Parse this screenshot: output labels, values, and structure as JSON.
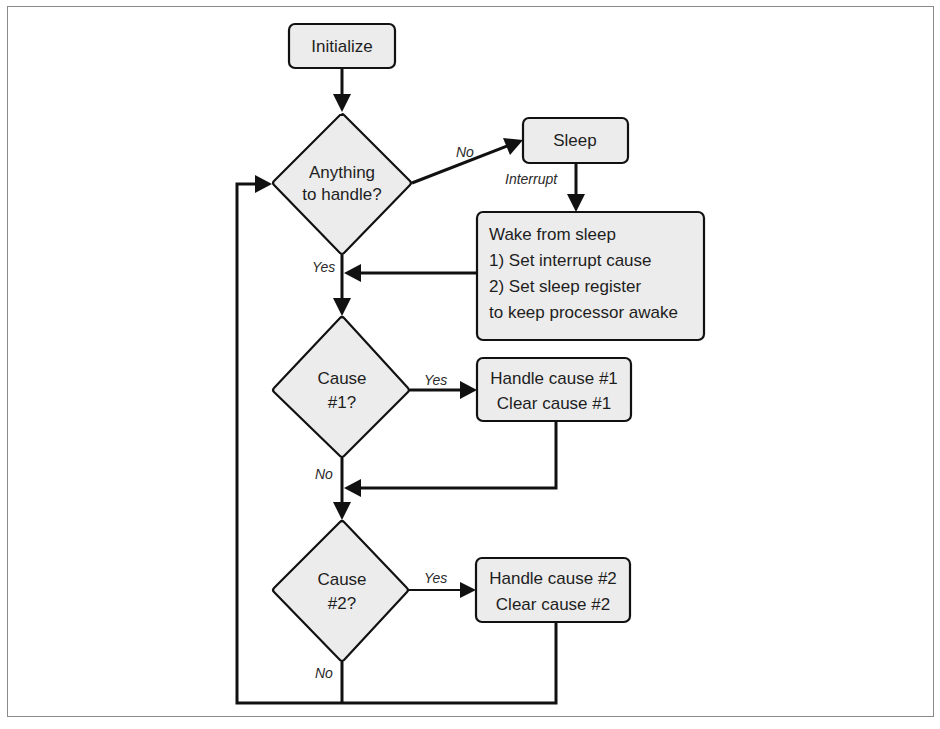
{
  "diagram": {
    "type": "flowchart",
    "nodes": {
      "initialize": {
        "label": "Initialize",
        "shape": "process"
      },
      "anything": {
        "line1": "Anything",
        "line2": "to handle?",
        "shape": "decision"
      },
      "sleep": {
        "label": "Sleep",
        "shape": "process"
      },
      "wake": {
        "line1": "Wake from sleep",
        "line2": "1) Set interrupt cause",
        "line3": "2) Set sleep register",
        "line4": "to keep processor awake",
        "shape": "process"
      },
      "cause1": {
        "line1": "Cause",
        "line2": "#1?",
        "shape": "decision"
      },
      "handle1": {
        "line1": "Handle cause #1",
        "line2": "Clear cause #1",
        "shape": "process"
      },
      "cause2": {
        "line1": "Cause",
        "line2": "#2?",
        "shape": "decision"
      },
      "handle2": {
        "line1": "Handle cause #2",
        "line2": "Clear cause #2",
        "shape": "process"
      }
    },
    "edge_labels": {
      "anything_no": "No",
      "sleep_interrupt": "Interrupt",
      "anything_yes": "Yes",
      "cause1_yes": "Yes",
      "cause1_no": "No",
      "cause2_yes": "Yes",
      "cause2_no": "No"
    },
    "edges": [
      {
        "from": "Initialize",
        "to": "Anything to handle?"
      },
      {
        "from": "Anything to handle?",
        "to": "Sleep",
        "label": "No"
      },
      {
        "from": "Sleep",
        "to": "Wake from sleep",
        "label": "Interrupt"
      },
      {
        "from": "Wake from sleep",
        "to": "Cause #1?"
      },
      {
        "from": "Anything to handle?",
        "to": "Cause #1?",
        "label": "Yes"
      },
      {
        "from": "Cause #1?",
        "to": "Handle cause #1",
        "label": "Yes"
      },
      {
        "from": "Cause #1?",
        "to": "Cause #2?",
        "label": "No"
      },
      {
        "from": "Handle cause #1",
        "to": "Cause #2?"
      },
      {
        "from": "Cause #2?",
        "to": "Handle cause #2",
        "label": "Yes"
      },
      {
        "from": "Cause #2?",
        "to": "Anything to handle?",
        "label": "No"
      },
      {
        "from": "Handle cause #2",
        "to": "Anything to handle?"
      }
    ]
  }
}
